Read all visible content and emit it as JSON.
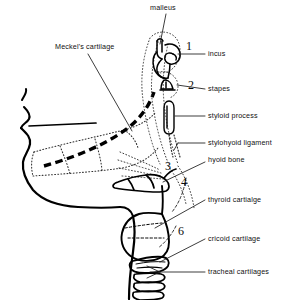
{
  "figure": {
    "type": "anatomical-line-diagram",
    "colors": {
      "ink": "#000000",
      "background": "#ffffff",
      "dotted_outline": "#3a3a3a",
      "dashed_cartilage": "#000000"
    }
  },
  "labels": {
    "malleus": "malleus",
    "meckels_cartilage": "Meckel's cartilage",
    "incus": "incus",
    "stapes": "stapes",
    "styloid_process": "styloid process",
    "stylohyoid_ligament": "stylohyoid ligament",
    "hyoid_bone": "hyoid bone",
    "thyroid_cartilage": "thyroid cartialge",
    "cricoid_cartilage": "cricoid cartilage",
    "tracheal_cartilages": "tracheal cartilages"
  },
  "callout_numbers": {
    "n1": "1",
    "n2": "2",
    "n3": "3",
    "n4": "4",
    "n6": "6"
  },
  "structures": [
    {
      "name": "face-profile",
      "style": "solid-thick",
      "description": "lateral head and neck outline with lips and chin"
    },
    {
      "name": "mandible-outline",
      "style": "dotted",
      "description": "dotted contour of developing mandible"
    },
    {
      "name": "meckels-cartilage-bar",
      "style": "dashed-thick",
      "description": "thick dashed bar within mandible"
    },
    {
      "name": "malleus-bone",
      "style": "solid",
      "description": "ossicle at top of ear region"
    },
    {
      "name": "incus-bone",
      "style": "solid",
      "description": "ossicle adjacent to malleus"
    },
    {
      "name": "stapes-bone",
      "style": "solid",
      "description": "small stirrup shaped ossicle"
    },
    {
      "name": "styloid-process-bone",
      "style": "solid",
      "description": "narrow elongated process"
    },
    {
      "name": "stylohyoid-ligament-line",
      "style": "dotted",
      "description": "slender band to hyoid"
    },
    {
      "name": "hyoid-bone-shape",
      "style": "solid",
      "description": "hyoid body and greater horn"
    },
    {
      "name": "thyroid-cartilage-shape",
      "style": "solid",
      "description": "large laryngeal cartilage"
    },
    {
      "name": "cricoid-cartilage-shape",
      "style": "solid",
      "description": "ring below thyroid cartilage"
    },
    {
      "name": "tracheal-cartilage-rings",
      "style": "solid",
      "count": 4,
      "description": "stacked tracheal rings"
    },
    {
      "name": "arch-contours",
      "style": "dotted",
      "description": "dotted pharyngeal arch boundary curves"
    }
  ]
}
